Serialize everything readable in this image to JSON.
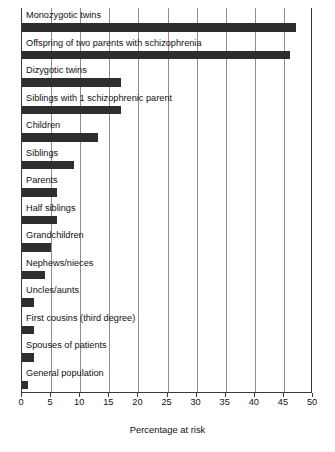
{
  "chart_data": {
    "type": "bar",
    "orientation": "horizontal",
    "title": "",
    "xlabel": "Percentage at risk",
    "ylabel": "",
    "xlim": [
      0,
      50
    ],
    "xticks": [
      0,
      5,
      10,
      15,
      20,
      25,
      30,
      35,
      40,
      45,
      50
    ],
    "grid": true,
    "legend": null,
    "bar_color": "#2e2e2e",
    "categories": [
      "Monozygotic twins",
      "Offspring of two parents with schizophrenia",
      "Dizygotic twins",
      "Siblings with 1 schizophrenic parent",
      "Children",
      "Siblings",
      "Parents",
      "Half siblings",
      "Grandchildren",
      "Nephews/nieces",
      "Uncles/aunts",
      "First cousins (third degree)",
      "Spouses of patients",
      "General population"
    ],
    "values": [
      47,
      46,
      17,
      17,
      13,
      9,
      6,
      6,
      5,
      4,
      2,
      2,
      2,
      1
    ]
  }
}
